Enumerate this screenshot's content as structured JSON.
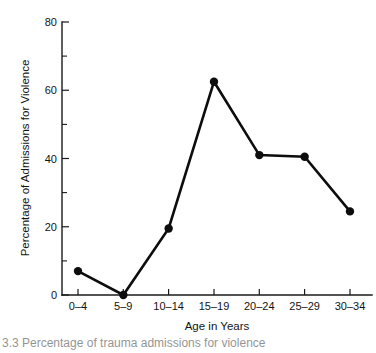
{
  "chart_data": {
    "type": "line",
    "title": "",
    "xlabel": "Age in Years",
    "ylabel": "Percentage of Admissions for Violence",
    "categories": [
      "0–4",
      "5–9",
      "10–14",
      "15–19",
      "20–24",
      "25–29",
      "30–34"
    ],
    "values": [
      7,
      0,
      19.5,
      62.5,
      41,
      40.5,
      24.5
    ],
    "series": [
      {
        "name": "Percentage of Admissions for Violence",
        "values": [
          7,
          0,
          19.5,
          62.5,
          41,
          40.5,
          24.5
        ]
      }
    ],
    "ylim": [
      0,
      80
    ],
    "yticks": [
      0,
      20,
      40,
      60,
      80
    ],
    "ytick_labels": [
      "0",
      "20",
      "40",
      "60",
      "80"
    ],
    "yminor_ticks": [
      10,
      30,
      50,
      70
    ],
    "grid": false,
    "legend": false,
    "legend_position": "none",
    "marker": "filled-circle",
    "line_color": "#0d0d0d",
    "marker_color": "#0d0d0d",
    "background_color": "#ffffff"
  },
  "caption": {
    "text": "3.3  Percentage of trauma admissions for violence"
  }
}
